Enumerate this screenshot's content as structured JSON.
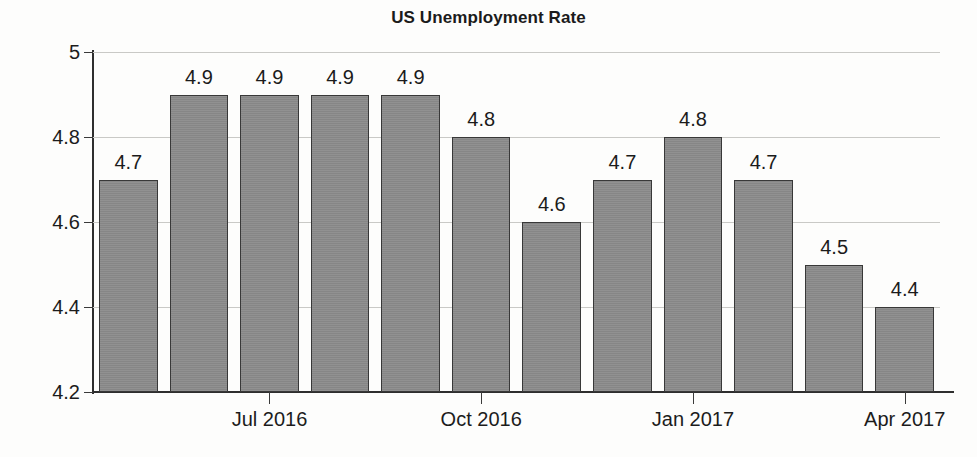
{
  "chart_data": {
    "type": "bar",
    "title": "US Unemployment Rate",
    "xlabel": "",
    "ylabel": "",
    "ylim": [
      4.2,
      5.0
    ],
    "yticks": [
      4.2,
      4.4,
      4.6,
      4.8,
      5.0
    ],
    "ytick_labels": [
      "4.2",
      "4.4",
      "4.6",
      "4.8",
      "5"
    ],
    "grid": true,
    "legend": "none",
    "categories": [
      "May 2016",
      "Jun 2016",
      "Jul 2016",
      "Aug 2016",
      "Sep 2016",
      "Oct 2016",
      "Nov 2016",
      "Dec 2016",
      "Jan 2017",
      "Feb 2017",
      "Mar 2017",
      "Apr 2017"
    ],
    "xtick_labels": [
      "Jul 2016",
      "Oct 2016",
      "Jan 2017",
      "Apr 2017"
    ],
    "xtick_indices": [
      2,
      5,
      8,
      11
    ],
    "values": [
      4.7,
      4.9,
      4.9,
      4.9,
      4.9,
      4.8,
      4.6,
      4.7,
      4.8,
      4.7,
      4.5,
      4.4
    ],
    "data_labels": [
      "4.7",
      "4.9",
      "4.9",
      "4.9",
      "4.9",
      "4.8",
      "4.6",
      "4.7",
      "4.8",
      "4.7",
      "4.5",
      "4.4"
    ],
    "bar_color": "#8c8c8c",
    "bar_edge_color": "#383838",
    "grid_color": "#c9c9c6",
    "axis_color": "#2e2e2e",
    "text_color": "#1b1b1b",
    "background": "#fdfdfc"
  }
}
